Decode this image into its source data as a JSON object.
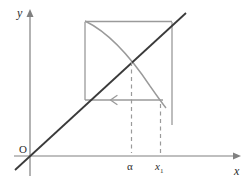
{
  "figure": {
    "kind": "cobweb-diagram",
    "background_color": "#ffffff"
  },
  "axes": {
    "y_label": "y",
    "x_label": "x",
    "origin_label": "O",
    "axis_color": "#808080",
    "x_axis_y": 156,
    "y_axis_x": 30
  },
  "ticks": [
    {
      "name": "alpha",
      "label": "α",
      "x": 131
    },
    {
      "name": "x1",
      "label": "x",
      "sub": "1",
      "x": 160
    }
  ],
  "curves": {
    "identity_line": {
      "name": "y = x",
      "color": "#3a3a3a",
      "from_x": 15,
      "from_y": 170,
      "to_x": 186,
      "to_y": 13
    },
    "decreasing_curve": {
      "name": "f(x)",
      "color": "#9a9a9a",
      "start_x": 85,
      "start_y": 21,
      "end_x": 166,
      "end_y": 108
    }
  },
  "box": {
    "name": "cobweb-box",
    "color": "#9a9a9a",
    "left": 85,
    "right": 172,
    "top": 22,
    "bottom": 100,
    "right_extension_bottom": 125
  },
  "arrow": {
    "name": "leftward-iteration-arrow",
    "color": "#9a9a9a",
    "y": 100,
    "from_x": 160,
    "to_x": 85,
    "head_x": 112,
    "direction": "left"
  },
  "dashed_guides": [
    {
      "name": "alpha-guide",
      "x": 131,
      "from_y": 62,
      "to_y": 153,
      "color": "#9a9a9a"
    },
    {
      "name": "x1-guide",
      "x": 160,
      "from_y": 104,
      "to_y": 153,
      "color": "#9a9a9a"
    }
  ]
}
